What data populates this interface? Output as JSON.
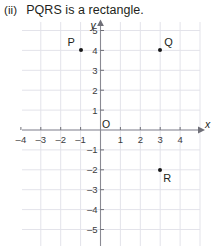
{
  "question": {
    "number": "(ii)",
    "text": "PQRS is a rectangle."
  },
  "chart_data": {
    "type": "scatter",
    "title": "",
    "xlabel": "x",
    "ylabel": "y",
    "xlim": [
      -5,
      5
    ],
    "ylim": [
      -6,
      6
    ],
    "grid": true,
    "grid_step": 1,
    "x_tick_labels": [
      "–4",
      "–3",
      "–2",
      "–1",
      "1",
      "2",
      "3",
      "4"
    ],
    "x_tick_values": [
      -4,
      -3,
      -2,
      -1,
      1,
      2,
      3,
      4
    ],
    "y_tick_labels": [
      "5",
      "4",
      "3",
      "2",
      "1",
      "–1",
      "–2",
      "–3",
      "–4",
      "–5"
    ],
    "y_tick_values": [
      5,
      4,
      3,
      2,
      1,
      -1,
      -2,
      -3,
      -4,
      -5
    ],
    "origin_label": "O",
    "points": [
      {
        "label": "P",
        "x": -1,
        "y": 4,
        "label_pos": "above-left"
      },
      {
        "label": "Q",
        "x": 3,
        "y": 4,
        "label_pos": "above-right"
      },
      {
        "label": "R",
        "x": 3,
        "y": -2,
        "label_pos": "below-right"
      }
    ],
    "missing_point": "S",
    "colors": {
      "grid": "#e3e3ea",
      "axis": "#8a8a93",
      "point": "#1a1a1a",
      "text": "#231f20"
    }
  }
}
